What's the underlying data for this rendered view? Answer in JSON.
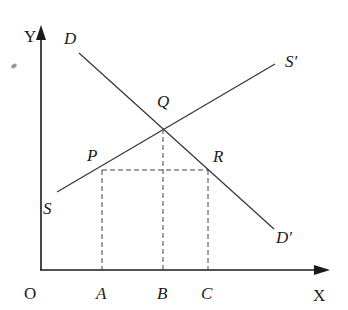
{
  "diagram": {
    "type": "supply-demand",
    "axes": {
      "origin_label": "O",
      "x_label": "X",
      "y_label": "Y",
      "x_ticks": [
        "A",
        "B",
        "C"
      ]
    },
    "curves": {
      "demand": {
        "start_label": "D",
        "end_label": "D′"
      },
      "supply": {
        "start_label": "S",
        "end_label": "S′"
      }
    },
    "points": {
      "equilibrium": "Q",
      "supply_point": "P",
      "demand_point": "R"
    },
    "colors": {
      "line": "#333333",
      "axis": "#1a1a1a",
      "background": "#ffffff"
    }
  }
}
